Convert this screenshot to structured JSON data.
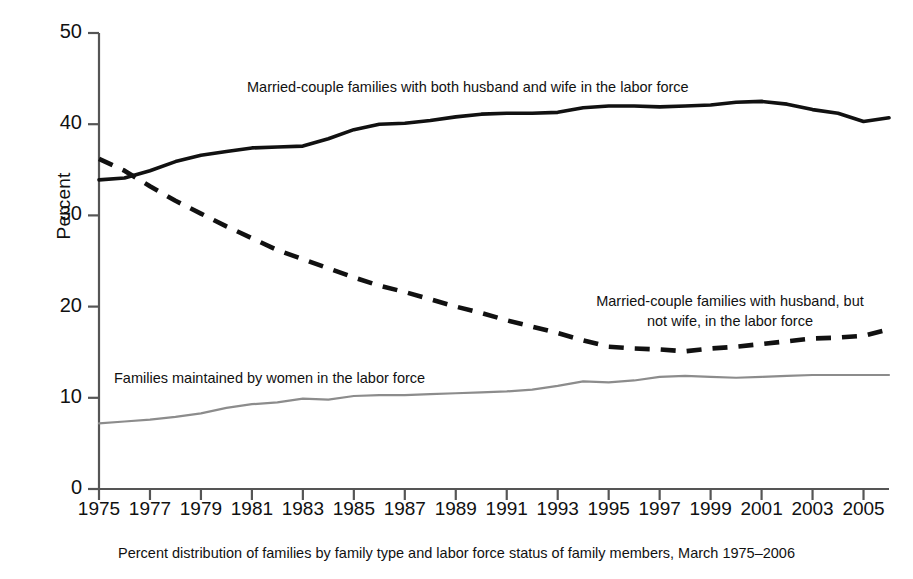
{
  "chart_data": {
    "type": "line",
    "title": "",
    "subtitle": "",
    "caption": "Percent distribution of families by family type and labor force status of family members, March 1975–2006",
    "xlabel": "",
    "ylabel": "Percent",
    "ylim": [
      0,
      50
    ],
    "xlim": [
      1975,
      2006
    ],
    "yticks": [
      0,
      10,
      20,
      30,
      40,
      50
    ],
    "xticks": [
      1975,
      1977,
      1979,
      1981,
      1983,
      1985,
      1987,
      1989,
      1991,
      1993,
      1995,
      1997,
      1999,
      2001,
      2003,
      2005
    ],
    "grid": false,
    "legend_position": "inline-annotations",
    "x": [
      1975,
      1976,
      1977,
      1978,
      1979,
      1980,
      1981,
      1982,
      1983,
      1984,
      1985,
      1986,
      1987,
      1988,
      1989,
      1990,
      1991,
      1992,
      1993,
      1994,
      1995,
      1996,
      1997,
      1998,
      1999,
      2000,
      2001,
      2002,
      2003,
      2004,
      2005,
      2006
    ],
    "series": [
      {
        "name": "Married-couple families with both husband and wife in the labor force",
        "style": "solid-black",
        "color": "#111111",
        "values": [
          33.9,
          34.1,
          34.9,
          35.9,
          36.6,
          37.0,
          37.4,
          37.5,
          37.6,
          38.4,
          39.4,
          40.0,
          40.1,
          40.4,
          40.8,
          41.1,
          41.2,
          41.2,
          41.3,
          41.8,
          42.0,
          42.0,
          41.9,
          42.0,
          42.1,
          42.4,
          42.5,
          42.2,
          41.6,
          41.2,
          40.3,
          40.7
        ]
      },
      {
        "name": "Married-couple families with husband, but not wife, in the labor force",
        "style": "dashed-black",
        "color": "#111111",
        "values": [
          36.2,
          34.9,
          33.2,
          31.6,
          30.2,
          28.8,
          27.5,
          26.2,
          25.2,
          24.2,
          23.2,
          22.3,
          21.6,
          20.8,
          20.0,
          19.3,
          18.5,
          17.8,
          17.1,
          16.3,
          15.6,
          15.4,
          15.3,
          15.1,
          15.4,
          15.6,
          15.9,
          16.2,
          16.5,
          16.6,
          16.8,
          17.5
        ]
      },
      {
        "name": "Families maintained by women in the labor force",
        "style": "solid-gray",
        "color": "#8c8c8c",
        "values": [
          7.2,
          7.4,
          7.6,
          7.9,
          8.3,
          8.9,
          9.3,
          9.5,
          9.9,
          9.8,
          10.2,
          10.3,
          10.3,
          10.4,
          10.5,
          10.6,
          10.7,
          10.9,
          11.3,
          11.8,
          11.7,
          11.9,
          12.3,
          12.4,
          12.3,
          12.2,
          12.3,
          12.4,
          12.5,
          12.5,
          12.5,
          12.5
        ]
      }
    ],
    "annotations": [
      {
        "id": "annotation-married-both",
        "text": "Married-couple families with both husband and wife in the labor force"
      },
      {
        "id": "annotation-husband-only",
        "text": "Married-couple families with husband, but\nnot wife, in the labor force"
      },
      {
        "id": "annotation-women-maintained",
        "text": "Families maintained by women in the labor force"
      }
    ]
  },
  "axis": {
    "y_label": "Percent",
    "y_ticks": [
      "50",
      "40",
      "30",
      "20",
      "10",
      "0"
    ],
    "x_ticks": [
      "1975",
      "1977",
      "1979",
      "1981",
      "1983",
      "1985",
      "1987",
      "1989",
      "1991",
      "1993",
      "1995",
      "1997",
      "1999",
      "2001",
      "2003",
      "2005"
    ]
  },
  "annotations": {
    "married_both": "Married-couple families with both husband and wife in the labor force",
    "husband_only_line1": "Married-couple families with husband, but",
    "husband_only_line2": "not wife, in the labor force",
    "women_maintained": "Families maintained by women in the labor force"
  },
  "caption": "Percent distribution of families by family type and labor force status of family members, March 1975–2006",
  "colors": {
    "series_solid": "#111111",
    "series_dashed": "#111111",
    "series_gray": "#8c8c8c",
    "axis": "#555555",
    "background": "#ffffff"
  }
}
